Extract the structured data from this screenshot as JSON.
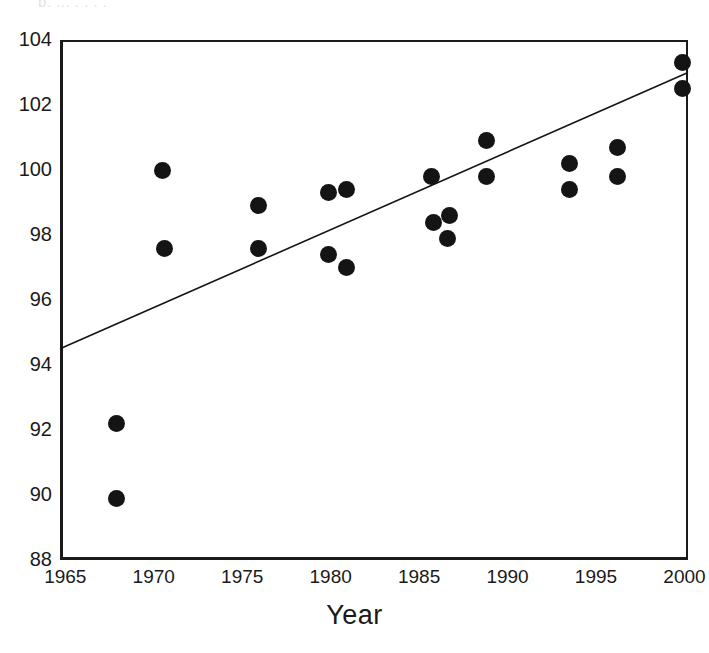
{
  "figure": {
    "clipped_caption": "p, ... . . . .",
    "background": "#ffffff",
    "ink_color": "#141414"
  },
  "axes": {
    "x_title": "Year",
    "y_title": "",
    "x_ticks": [
      "1965",
      "1970",
      "1975",
      "1980",
      "1985",
      "1990",
      "1995",
      "2000"
    ],
    "y_ticks": [
      "104",
      "102",
      "100",
      "98",
      "96",
      "94",
      "92",
      "90",
      "88"
    ]
  },
  "chart_data": {
    "type": "scatter",
    "title": "",
    "xlabel": "Year",
    "ylabel": "",
    "xlim": [
      1964.7,
      2000.2
    ],
    "ylim": [
      88,
      104
    ],
    "xticks": [
      1965,
      1970,
      1975,
      1980,
      1985,
      1990,
      1995,
      2000
    ],
    "yticks": [
      88,
      90,
      92,
      94,
      96,
      98,
      100,
      102,
      104
    ],
    "grid": false,
    "legend": null,
    "marker": {
      "shape": "circle",
      "color": "#141414",
      "size_px": 17
    },
    "points": [
      {
        "x": 1967.9,
        "y": 92.2
      },
      {
        "x": 1967.9,
        "y": 89.9
      },
      {
        "x": 1970.5,
        "y": 100.0
      },
      {
        "x": 1970.6,
        "y": 97.6
      },
      {
        "x": 1975.9,
        "y": 98.9
      },
      {
        "x": 1975.9,
        "y": 97.6
      },
      {
        "x": 1979.9,
        "y": 99.3
      },
      {
        "x": 1980.9,
        "y": 99.4
      },
      {
        "x": 1979.9,
        "y": 97.4
      },
      {
        "x": 1980.9,
        "y": 97.0
      },
      {
        "x": 1985.7,
        "y": 99.8
      },
      {
        "x": 1985.8,
        "y": 98.4
      },
      {
        "x": 1986.7,
        "y": 98.6
      },
      {
        "x": 1986.6,
        "y": 97.9
      },
      {
        "x": 1988.8,
        "y": 100.9
      },
      {
        "x": 1988.8,
        "y": 99.8
      },
      {
        "x": 1993.5,
        "y": 100.2
      },
      {
        "x": 1993.5,
        "y": 99.4
      },
      {
        "x": 1996.2,
        "y": 100.7
      },
      {
        "x": 1996.2,
        "y": 99.8
      },
      {
        "x": 1999.9,
        "y": 103.3
      },
      {
        "x": 1999.9,
        "y": 102.5
      }
    ],
    "trendline": {
      "type": "linear-fit",
      "x_start": 1964.7,
      "y_start": 94.5,
      "x_end": 2000.2,
      "y_end": 103.0,
      "color": "#141414",
      "width_px": 1.6
    }
  }
}
